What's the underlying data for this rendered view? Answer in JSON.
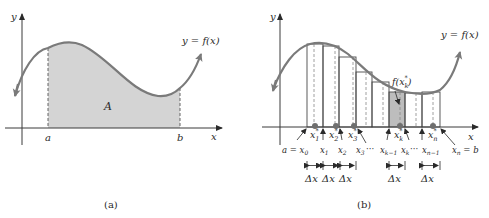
{
  "panels": [
    {
      "id": "a",
      "caption": "(a)",
      "axis_x_label": "x",
      "axis_y_label": "y",
      "curve_label": "y = f(x)",
      "area_label": "A",
      "left_bound_label": "a",
      "right_bound_label": "b"
    },
    {
      "id": "b",
      "caption": "(b)",
      "axis_x_label": "x",
      "axis_y_label": "y",
      "curve_label": "y = f(x)",
      "sample_value_label": "f(x",
      "sample_value_sub": "k",
      "sample_value_sup": "*",
      "sample_value_close": ")",
      "partition_labels": {
        "x0": "a = x",
        "x0_sub": "0",
        "x1": "x",
        "x1_sub": "1",
        "x2": "x",
        "x2_sub": "2",
        "x3": "x",
        "x3_sub": "3",
        "ellipsis1": "···",
        "xkm1": "x",
        "xkm1_sub": "k−1",
        "xk": "x",
        "xk_sub": "k",
        "ellipsis2": "···",
        "xnm1": "x",
        "xnm1_sub": "n−1",
        "xn": "x",
        "xn_sub": "n",
        "xn_suffix": " = b"
      },
      "sample_points": [
        {
          "label": "x",
          "sub": "1",
          "sup": "*"
        },
        {
          "label": "x",
          "sub": "2",
          "sup": "*"
        },
        {
          "label": "x",
          "sub": "3",
          "sup": "*"
        },
        {
          "label": "x",
          "sub": "k",
          "sup": "*"
        },
        {
          "label": "x",
          "sub": "n",
          "sup": "*"
        }
      ],
      "delta_label": "Δx",
      "delta_count": 5
    }
  ],
  "colors": {
    "curve": "#7a7a7a",
    "shade": "#d4d4d4",
    "shade_highlight": "#bdbdbd",
    "axis": "#3a3a3a",
    "rect_edge": "#4a4a4a",
    "dot": "#6f6f6f"
  }
}
